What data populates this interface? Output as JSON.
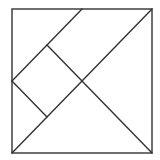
{
  "diagram": {
    "stroke_color": "#333333",
    "background": "#ffffff",
    "outer_square": {
      "x1": 12,
      "y1": 9,
      "x2": 152,
      "y2": 153
    },
    "lines": [
      {
        "name": "main-diagonal",
        "x1": 12,
        "y1": 153,
        "x2": 152,
        "y2": 9
      },
      {
        "name": "center-to-bottom-right",
        "x1": 82,
        "y1": 81,
        "x2": 152,
        "y2": 153
      },
      {
        "name": "top-parallel-diagonal",
        "x1": 12,
        "y1": 81,
        "x2": 82,
        "y2": 9
      },
      {
        "name": "small-square-upper-edge",
        "x1": 47,
        "y1": 45,
        "x2": 82,
        "y2": 81
      },
      {
        "name": "small-square-lower-edge",
        "x1": 12,
        "y1": 81,
        "x2": 47,
        "y2": 117
      }
    ]
  }
}
